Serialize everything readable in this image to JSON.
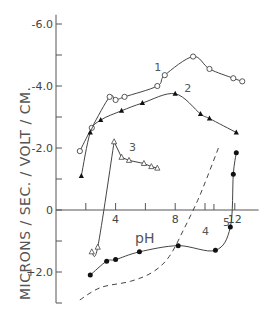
{
  "chart_data": {
    "type": "line",
    "title": "",
    "xlabel": "pH",
    "ylabel": "MICRONS / SEC. / VOLT / CM.",
    "xlim": [
      0,
      13.6
    ],
    "ylim": [
      3.0,
      -6.2
    ],
    "y_inverted": true,
    "x_ticks": [
      2,
      4,
      6,
      8,
      10,
      12
    ],
    "x_tick_labels": [
      "",
      "4",
      "",
      "8",
      "",
      "12"
    ],
    "y_ticks": [
      -6.0,
      -5.0,
      -4.0,
      -3.0,
      -2.0,
      -1.0,
      0,
      1.0,
      2.0,
      3.0
    ],
    "y_tick_labels": {
      "-6.0": "-6.0",
      "-4.0": "-4.0",
      "-2.0": "-2.0",
      "0": "0",
      "2.0": "+2.0"
    },
    "grid": false,
    "legend": "inline numeric labels",
    "series": [
      {
        "name": "1",
        "marker": "open-circle",
        "line": "solid",
        "x": [
          1.6,
          2.4,
          3.6,
          4.0,
          4.6,
          6.8,
          7.3,
          9.2,
          10.3,
          11.9,
          12.5
        ],
        "y": [
          -1.9,
          -2.65,
          -3.65,
          -3.55,
          -3.65,
          -4.0,
          -4.35,
          -4.95,
          -4.55,
          -4.25,
          -4.15
        ],
        "label_position": {
          "x": 6.6,
          "y": -4.5
        }
      },
      {
        "name": "2",
        "marker": "filled-triangle",
        "line": "solid",
        "x": [
          1.7,
          2.3,
          3.0,
          4.4,
          5.8,
          8.0,
          9.7,
          10.3,
          12.1
        ],
        "y": [
          -1.1,
          -2.5,
          -2.9,
          -3.2,
          -3.45,
          -3.75,
          -3.1,
          -2.95,
          -2.5
        ],
        "label_position": {
          "x": 8.6,
          "y": -3.8
        }
      },
      {
        "name": "3",
        "marker": "open-triangle",
        "line": "solid",
        "x": [
          2.4,
          2.8,
          3.9,
          4.4,
          4.9,
          5.9,
          6.4,
          6.8
        ],
        "y": [
          1.35,
          1.2,
          -2.2,
          -1.7,
          -1.6,
          -1.5,
          -1.4,
          -1.35
        ],
        "label_position": {
          "x": 4.9,
          "y": -1.9
        }
      },
      {
        "name": "4",
        "marker": "none",
        "line": "dashed",
        "x": [
          1.6,
          3.0,
          5.0,
          6.5,
          7.6,
          8.6,
          9.5,
          10.1,
          10.9
        ],
        "y": [
          2.9,
          2.5,
          2.3,
          2.0,
          1.5,
          0.6,
          -0.3,
          -1.0,
          -2.0
        ],
        "label_position": {
          "x": 9.8,
          "y": 0.8
        }
      },
      {
        "name": "5",
        "marker": "filled-circle",
        "line": "solid",
        "x": [
          2.3,
          3.4,
          4.0,
          5.6,
          8.2,
          10.7,
          11.7,
          11.9,
          12.1
        ],
        "y": [
          2.1,
          1.65,
          1.6,
          1.35,
          1.15,
          1.3,
          0.55,
          -1.15,
          -1.85
        ],
        "label_position": {
          "x": 11.2,
          "y": 0.5
        }
      }
    ]
  }
}
